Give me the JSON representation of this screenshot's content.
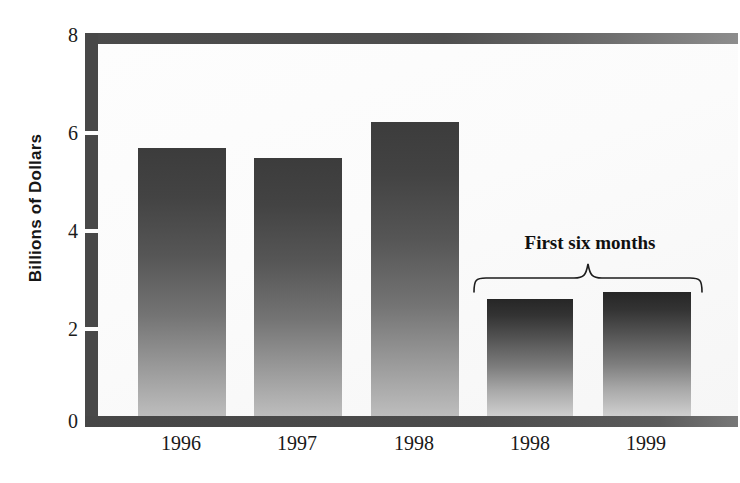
{
  "chart_data": {
    "type": "bar",
    "title": "",
    "xlabel": "",
    "ylabel": "Billions of Dollars",
    "categories": [
      "1996",
      "1997",
      "1998",
      "1998",
      "1999"
    ],
    "values": [
      5.68,
      5.46,
      6.22,
      2.48,
      2.62
    ],
    "ylim": [
      0,
      8
    ],
    "yticks": [
      0,
      2,
      4,
      6,
      8
    ],
    "ytick_labels": [
      "0",
      "2",
      "4",
      "6",
      "8"
    ],
    "grid": false,
    "legend": null,
    "annotations": [
      {
        "text": "First six months",
        "type": "brace",
        "covers_categories": [
          3,
          4
        ]
      }
    ],
    "series": [
      {
        "name": "Value",
        "values": [
          5.68,
          5.46,
          6.22,
          2.48,
          2.62
        ]
      }
    ],
    "colors": {
      "bar_top": "#3c3c3c",
      "bar_bottom": "#bdbdbd",
      "axis": "#484848",
      "plot_background": "#fbfbfb",
      "text": "#181818"
    }
  },
  "figure": {
    "yaxis_title": "Billions of Dollars",
    "ytick_labels": [
      "8",
      "6",
      "4",
      "2",
      "0"
    ],
    "xtick_labels": [
      "1996",
      "1997",
      "1998",
      "1998",
      "1999"
    ],
    "annotation_label": "First six months"
  }
}
